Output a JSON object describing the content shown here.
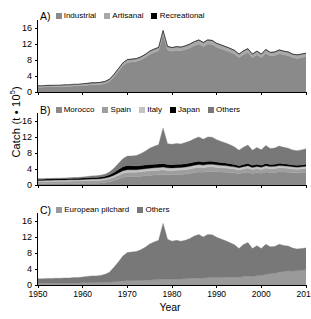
{
  "axes": {
    "y_label_text": "Catch (t • 10",
    "y_label_sup": "5",
    "y_label_close": ")",
    "y_ticks": [
      "0",
      "4",
      "8",
      "12",
      "16"
    ],
    "x_ticks": [
      "1950",
      "1960",
      "1970",
      "1980",
      "1990",
      "2000",
      "2010"
    ],
    "x_title": "Year"
  },
  "panels": {
    "a": {
      "tag": "A)",
      "legend": [
        {
          "label": "Industrial",
          "color": "#8a8a8a"
        },
        {
          "label": "Artisanal",
          "color": "#a8a8a8"
        },
        {
          "label": "Recreational",
          "color": "#000000"
        }
      ]
    },
    "b": {
      "tag": "B)",
      "legend": [
        {
          "label": "Morocco",
          "color": "#8a8a8a"
        },
        {
          "label": "Spain",
          "color": "#9e9e9e"
        },
        {
          "label": "Italy",
          "color": "#c4c4c4"
        },
        {
          "label": "Japan",
          "color": "#000000"
        },
        {
          "label": "Others",
          "color": "#787878"
        }
      ]
    },
    "c": {
      "tag": "C)",
      "legend": [
        {
          "label": "European pilchard",
          "color": "#9a9a9a"
        },
        {
          "label": "Others",
          "color": "#787878"
        }
      ]
    }
  },
  "chart_data": [
    {
      "type": "area",
      "panel": "A",
      "title": "A)",
      "xlabel": "Year",
      "ylabel": "Catch (t * 10^5)",
      "xlim": [
        1950,
        2010
      ],
      "ylim": [
        0,
        18
      ],
      "grid": false,
      "legend_position": "top",
      "stacked": true,
      "x": [
        1950,
        1951,
        1952,
        1953,
        1954,
        1955,
        1956,
        1957,
        1958,
        1959,
        1960,
        1961,
        1962,
        1963,
        1964,
        1965,
        1966,
        1967,
        1968,
        1969,
        1970,
        1971,
        1972,
        1973,
        1974,
        1975,
        1976,
        1977,
        1978,
        1979,
        1980,
        1981,
        1982,
        1983,
        1984,
        1985,
        1986,
        1987,
        1988,
        1989,
        1990,
        1991,
        1992,
        1993,
        1994,
        1995,
        1996,
        1997,
        1998,
        1999,
        2000,
        2001,
        2002,
        2003,
        2004,
        2005,
        2006,
        2007,
        2008,
        2009,
        2010
      ],
      "series": [
        {
          "name": "Industrial",
          "color": "#8a8a8a",
          "values": [
            1.2,
            1.2,
            1.3,
            1.3,
            1.3,
            1.3,
            1.4,
            1.4,
            1.5,
            1.5,
            1.6,
            1.7,
            1.8,
            1.8,
            1.9,
            2.1,
            2.6,
            3.8,
            5.2,
            6.6,
            7.4,
            7.5,
            7.6,
            8.0,
            8.6,
            9.4,
            9.9,
            10.3,
            14.4,
            10.5,
            10.2,
            10.4,
            10.3,
            10.6,
            11.0,
            11.6,
            12.0,
            11.4,
            12.0,
            11.9,
            11.2,
            10.8,
            10.4,
            10.0,
            9.5,
            8.6,
            9.4,
            9.9,
            8.6,
            9.3,
            8.6,
            9.7,
            9.0,
            9.1,
            9.6,
            9.3,
            9.1,
            8.6,
            8.4,
            8.6,
            8.8
          ]
        },
        {
          "name": "Artisanal",
          "color": "#a8a8a8",
          "values": [
            0.35,
            0.35,
            0.35,
            0.35,
            0.38,
            0.38,
            0.4,
            0.4,
            0.42,
            0.42,
            0.45,
            0.45,
            0.48,
            0.48,
            0.5,
            0.52,
            0.55,
            0.58,
            0.62,
            0.65,
            0.68,
            0.7,
            0.72,
            0.74,
            0.76,
            0.78,
            0.8,
            0.82,
            0.95,
            0.86,
            0.88,
            0.9,
            0.9,
            0.92,
            0.95,
            0.96,
            0.98,
            0.95,
            0.98,
            0.98,
            0.95,
            0.94,
            0.92,
            0.9,
            0.88,
            0.85,
            0.88,
            0.9,
            0.85,
            0.88,
            0.86,
            0.9,
            0.88,
            0.88,
            0.9,
            0.9,
            0.88,
            0.86,
            0.85,
            0.86,
            0.88
          ]
        },
        {
          "name": "Recreational",
          "color": "#000000",
          "values": [
            0.02,
            0.02,
            0.02,
            0.02,
            0.02,
            0.02,
            0.02,
            0.02,
            0.03,
            0.03,
            0.03,
            0.03,
            0.03,
            0.03,
            0.03,
            0.04,
            0.04,
            0.04,
            0.04,
            0.05,
            0.05,
            0.05,
            0.05,
            0.05,
            0.05,
            0.06,
            0.06,
            0.06,
            0.06,
            0.06,
            0.06,
            0.06,
            0.06,
            0.06,
            0.06,
            0.06,
            0.06,
            0.06,
            0.06,
            0.06,
            0.06,
            0.06,
            0.06,
            0.06,
            0.06,
            0.06,
            0.06,
            0.06,
            0.06,
            0.06,
            0.06,
            0.06,
            0.06,
            0.06,
            0.06,
            0.06,
            0.06,
            0.06,
            0.06,
            0.06,
            0.06
          ]
        }
      ]
    },
    {
      "type": "area",
      "panel": "B",
      "title": "B)",
      "xlabel": "Year",
      "ylabel": "Catch (t * 10^5)",
      "xlim": [
        1950,
        2010
      ],
      "ylim": [
        0,
        18
      ],
      "grid": false,
      "legend_position": "top",
      "stacked": true,
      "x": [
        1950,
        1951,
        1952,
        1953,
        1954,
        1955,
        1956,
        1957,
        1958,
        1959,
        1960,
        1961,
        1962,
        1963,
        1964,
        1965,
        1966,
        1967,
        1968,
        1969,
        1970,
        1971,
        1972,
        1973,
        1974,
        1975,
        1976,
        1977,
        1978,
        1979,
        1980,
        1981,
        1982,
        1983,
        1984,
        1985,
        1986,
        1987,
        1988,
        1989,
        1990,
        1991,
        1992,
        1993,
        1994,
        1995,
        1996,
        1997,
        1998,
        1999,
        2000,
        2001,
        2002,
        2003,
        2004,
        2005,
        2006,
        2007,
        2008,
        2009,
        2010
      ],
      "series": [
        {
          "name": "Morocco",
          "color": "#8a8a8a",
          "values": [
            0.3,
            0.3,
            0.32,
            0.32,
            0.34,
            0.34,
            0.36,
            0.36,
            0.38,
            0.38,
            0.4,
            0.42,
            0.44,
            0.46,
            0.5,
            0.6,
            0.8,
            1.1,
            1.5,
            1.9,
            2.1,
            2.1,
            2.1,
            2.2,
            2.3,
            2.4,
            2.5,
            2.55,
            2.6,
            2.55,
            2.55,
            2.6,
            2.65,
            2.75,
            2.9,
            3.1,
            3.25,
            3.2,
            3.35,
            3.4,
            3.3,
            3.25,
            3.2,
            3.1,
            3.0,
            2.85,
            3.05,
            3.2,
            2.9,
            3.1,
            2.95,
            3.25,
            3.1,
            3.15,
            3.3,
            3.25,
            3.2,
            3.1,
            3.05,
            3.1,
            3.2
          ]
        },
        {
          "name": "Spain",
          "color": "#9e9e9e",
          "values": [
            0.55,
            0.55,
            0.58,
            0.58,
            0.58,
            0.58,
            0.6,
            0.6,
            0.62,
            0.62,
            0.62,
            0.64,
            0.66,
            0.66,
            0.68,
            0.7,
            0.75,
            0.85,
            0.95,
            1.05,
            1.1,
            1.1,
            1.08,
            1.1,
            1.12,
            1.14,
            1.15,
            1.15,
            1.2,
            1.1,
            1.08,
            1.1,
            1.08,
            1.1,
            1.12,
            1.15,
            1.18,
            1.12,
            1.15,
            1.14,
            1.1,
            1.08,
            1.05,
            1.02,
            0.98,
            0.92,
            0.98,
            1.02,
            0.95,
            0.98,
            0.95,
            1.0,
            0.96,
            0.96,
            1.0,
            0.98,
            0.96,
            0.92,
            0.9,
            0.92,
            0.95
          ]
        },
        {
          "name": "Italy",
          "color": "#c4c4c4",
          "values": [
            0.3,
            0.3,
            0.3,
            0.3,
            0.32,
            0.32,
            0.32,
            0.34,
            0.34,
            0.34,
            0.36,
            0.36,
            0.38,
            0.38,
            0.4,
            0.42,
            0.45,
            0.5,
            0.55,
            0.6,
            0.62,
            0.62,
            0.62,
            0.64,
            0.64,
            0.66,
            0.66,
            0.66,
            0.7,
            0.64,
            0.64,
            0.64,
            0.64,
            0.66,
            0.66,
            0.68,
            0.7,
            0.66,
            0.68,
            0.66,
            0.64,
            0.62,
            0.6,
            0.58,
            0.56,
            0.52,
            0.56,
            0.58,
            0.54,
            0.56,
            0.54,
            0.58,
            0.55,
            0.55,
            0.57,
            0.56,
            0.55,
            0.52,
            0.51,
            0.52,
            0.54
          ]
        },
        {
          "name": "Japan",
          "color": "#000000",
          "values": [
            0.3,
            0.3,
            0.3,
            0.32,
            0.32,
            0.32,
            0.34,
            0.34,
            0.34,
            0.36,
            0.36,
            0.38,
            0.38,
            0.4,
            0.42,
            0.46,
            0.55,
            0.7,
            0.85,
            1.0,
            1.05,
            1.0,
            0.95,
            0.95,
            0.95,
            0.92,
            0.9,
            0.88,
            0.88,
            0.85,
            0.82,
            0.82,
            0.8,
            0.8,
            0.8,
            0.8,
            0.8,
            0.76,
            0.78,
            0.76,
            0.72,
            0.7,
            0.66,
            0.62,
            0.58,
            0.52,
            0.56,
            0.58,
            0.52,
            0.54,
            0.52,
            0.55,
            0.52,
            0.52,
            0.54,
            0.52,
            0.5,
            0.48,
            0.47,
            0.48,
            0.5
          ]
        },
        {
          "name": "Others",
          "color": "#787878",
          "values": [
            0.12,
            0.12,
            0.13,
            0.13,
            0.14,
            0.15,
            0.16,
            0.16,
            0.17,
            0.18,
            0.27,
            0.32,
            0.4,
            0.42,
            0.44,
            0.5,
            0.7,
            1.05,
            1.55,
            2.0,
            2.35,
            2.45,
            2.6,
            2.95,
            3.45,
            4.05,
            4.5,
            4.85,
            8.85,
            5.2,
            5.1,
            5.2,
            5.1,
            5.3,
            5.5,
            5.85,
            6.1,
            5.7,
            6.05,
            6.0,
            5.55,
            5.25,
            5.0,
            4.75,
            4.4,
            3.85,
            4.3,
            4.6,
            3.8,
            4.2,
            3.85,
            4.5,
            4.0,
            4.05,
            4.35,
            4.1,
            4.0,
            3.75,
            3.65,
            3.75,
            3.85
          ]
        }
      ]
    },
    {
      "type": "area",
      "panel": "C",
      "title": "C)",
      "xlabel": "Year",
      "ylabel": "Catch (t * 10^5)",
      "xlim": [
        1950,
        2010
      ],
      "ylim": [
        0,
        18
      ],
      "grid": false,
      "legend_position": "top",
      "stacked": true,
      "x": [
        1950,
        1951,
        1952,
        1953,
        1954,
        1955,
        1956,
        1957,
        1958,
        1959,
        1960,
        1961,
        1962,
        1963,
        1964,
        1965,
        1966,
        1967,
        1968,
        1969,
        1970,
        1971,
        1972,
        1973,
        1974,
        1975,
        1976,
        1977,
        1978,
        1979,
        1980,
        1981,
        1982,
        1983,
        1984,
        1985,
        1986,
        1987,
        1988,
        1989,
        1990,
        1991,
        1992,
        1993,
        1994,
        1995,
        1996,
        1997,
        1998,
        1999,
        2000,
        2001,
        2002,
        2003,
        2004,
        2005,
        2006,
        2007,
        2008,
        2009,
        2010
      ],
      "series": [
        {
          "name": "European pilchard",
          "color": "#9a9a9a",
          "values": [
            0.45,
            0.45,
            0.46,
            0.46,
            0.48,
            0.48,
            0.5,
            0.5,
            0.52,
            0.52,
            0.54,
            0.56,
            0.58,
            0.6,
            0.62,
            0.66,
            0.72,
            0.8,
            0.9,
            1.0,
            1.05,
            1.08,
            1.1,
            1.15,
            1.2,
            1.25,
            1.3,
            1.35,
            1.45,
            1.4,
            1.42,
            1.48,
            1.5,
            1.55,
            1.62,
            1.7,
            1.78,
            1.72,
            1.8,
            1.85,
            1.88,
            1.9,
            1.92,
            1.95,
            1.98,
            1.95,
            2.1,
            2.25,
            2.15,
            2.35,
            2.4,
            2.7,
            2.8,
            2.95,
            3.2,
            3.4,
            3.55,
            3.5,
            3.55,
            3.7,
            3.85
          ]
        },
        {
          "name": "Others",
          "color": "#787878",
          "values": [
            1.12,
            1.12,
            1.19,
            1.19,
            1.2,
            1.2,
            1.26,
            1.26,
            1.33,
            1.33,
            1.49,
            1.56,
            1.7,
            1.68,
            1.78,
            2.0,
            2.47,
            3.62,
            4.86,
            6.25,
            7.08,
            7.17,
            7.27,
            7.64,
            8.21,
            8.99,
            9.46,
            9.83,
            13.96,
            10.02,
            9.54,
            9.68,
            9.44,
            9.63,
            9.99,
            10.52,
            10.86,
            10.29,
            10.84,
            10.69,
            10.04,
            9.58,
            9.16,
            8.63,
            8.06,
            7.16,
            8.04,
            8.35,
            6.96,
            7.49,
            6.72,
            7.47,
            6.74,
            6.69,
            6.96,
            6.48,
            6.19,
            5.72,
            5.46,
            5.42,
            5.43
          ]
        }
      ]
    }
  ]
}
